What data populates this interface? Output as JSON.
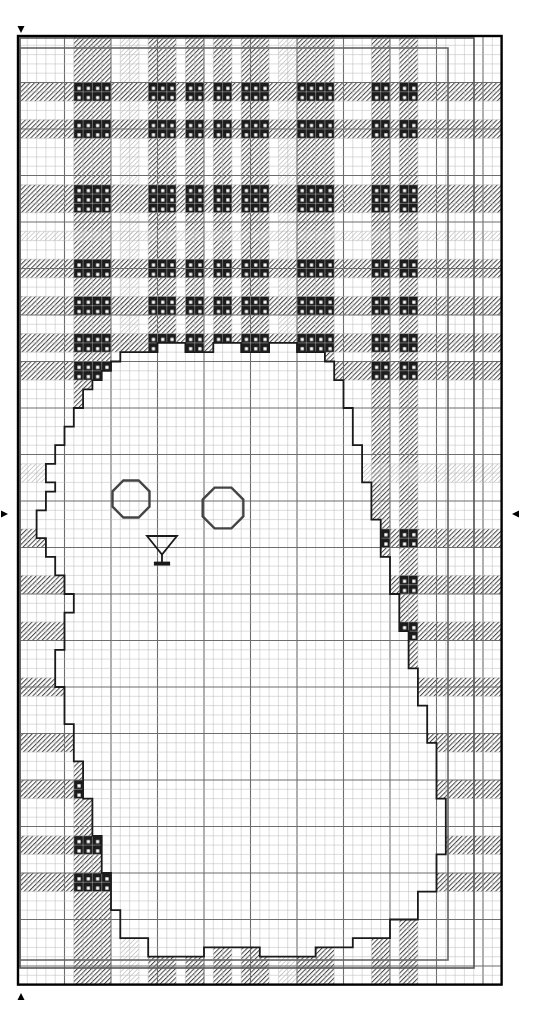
{
  "document": {
    "title": "Cross Stitch Pattern Chart",
    "type": "needlework-chart"
  },
  "canvas": {
    "width": 535,
    "height": 1016,
    "background_color": "#ffffff"
  },
  "grid": {
    "origin_x": 18,
    "origin_y": 36,
    "cell_size": 9.3,
    "cols": 52,
    "rows": 102,
    "minor_line_color": "#b8b8b8",
    "minor_line_width": 0.5,
    "major_line_color": "#6d6d6d",
    "major_line_width": 1.1,
    "major_every": 5,
    "outer_border_color": "#000000",
    "outer_border_width": 2.4
  },
  "center_markers": {
    "color": "#000000",
    "top": {
      "name": "top-center-marker",
      "x": 21,
      "y": 33,
      "direction": "down"
    },
    "bottom": {
      "name": "bottom-center-marker",
      "x": 21,
      "y": 993,
      "direction": "up"
    },
    "left": {
      "name": "left-center-marker",
      "x": 8,
      "y": 514,
      "direction": "right"
    },
    "right": {
      "name": "right-center-marker",
      "x": 512,
      "y": 514,
      "direction": "left"
    }
  },
  "inner_frames": [
    {
      "name": "inner-frame-outer",
      "x": 20,
      "y": 38,
      "width": 454,
      "height": 930,
      "color": "#555555",
      "width_px": 1.6
    },
    {
      "name": "inner-frame-inner",
      "x": 20,
      "y": 48,
      "width": 428,
      "height": 912,
      "color": "#666666",
      "width_px": 1.6
    }
  ],
  "plaid": {
    "name": "tartan-background",
    "description": "Tartan plaid fill occupying upper region and left/right margins",
    "colors": {
      "hatch_dark": "#3a3a3a",
      "hatch_mid": "#6a6a6a",
      "hatch_light": "#b4b4b4",
      "block_dark": "#1c1c1c",
      "block_dot": "#ffffff"
    },
    "vertical_bands": [
      {
        "col": 6,
        "span": 4,
        "style": "dark"
      },
      {
        "col": 11,
        "span": 2,
        "style": "light"
      },
      {
        "col": 14,
        "span": 3,
        "style": "dark"
      },
      {
        "col": 18,
        "span": 2,
        "style": "dark"
      },
      {
        "col": 21,
        "span": 2,
        "style": "dark"
      },
      {
        "col": 24,
        "span": 3,
        "style": "dark"
      },
      {
        "col": 28,
        "span": 2,
        "style": "light"
      },
      {
        "col": 30,
        "span": 4,
        "style": "dark"
      },
      {
        "col": 38,
        "span": 2,
        "style": "dark"
      },
      {
        "col": 41,
        "span": 2,
        "style": "dark"
      }
    ],
    "horizontal_bands": [
      {
        "row": 5,
        "span": 2,
        "style": "dark"
      },
      {
        "row": 9,
        "span": 2,
        "style": "dark"
      },
      {
        "row": 16,
        "span": 3,
        "style": "dark"
      },
      {
        "row": 21,
        "span": 1,
        "style": "light"
      },
      {
        "row": 24,
        "span": 2,
        "style": "dark"
      },
      {
        "row": 28,
        "span": 2,
        "style": "dark"
      },
      {
        "row": 32,
        "span": 2,
        "style": "dark"
      },
      {
        "row": 35,
        "span": 2,
        "style": "dark"
      },
      {
        "row": 46,
        "span": 2,
        "style": "light"
      },
      {
        "row": 53,
        "span": 2,
        "style": "dark"
      },
      {
        "row": 58,
        "span": 2,
        "style": "dark"
      },
      {
        "row": 63,
        "span": 2,
        "style": "dark"
      },
      {
        "row": 69,
        "span": 2,
        "style": "dark"
      },
      {
        "row": 75,
        "span": 2,
        "style": "dark"
      },
      {
        "row": 80,
        "span": 2,
        "style": "dark"
      },
      {
        "row": 86,
        "span": 2,
        "style": "dark"
      },
      {
        "row": 90,
        "span": 2,
        "style": "dark"
      }
    ]
  },
  "figure": {
    "name": "cat-silhouette",
    "outline_color": "#1a1a1a",
    "outline_width": 1.8,
    "fill": "#ffffff",
    "path_cells": [
      [
        11,
        34
      ],
      [
        11,
        35
      ],
      [
        10,
        35
      ],
      [
        10,
        36
      ],
      [
        9,
        36
      ],
      [
        9,
        37
      ],
      [
        8,
        37
      ],
      [
        8,
        38
      ],
      [
        7,
        38
      ],
      [
        7,
        40
      ],
      [
        6,
        40
      ],
      [
        6,
        42
      ],
      [
        5,
        42
      ],
      [
        5,
        44
      ],
      [
        4,
        44
      ],
      [
        4,
        46
      ],
      [
        3,
        46
      ],
      [
        3,
        48
      ],
      [
        4,
        48
      ],
      [
        4,
        49
      ],
      [
        3,
        49
      ],
      [
        3,
        51
      ],
      [
        2,
        51
      ],
      [
        2,
        54
      ],
      [
        3,
        54
      ],
      [
        3,
        56
      ],
      [
        4,
        56
      ],
      [
        4,
        58
      ],
      [
        5,
        58
      ],
      [
        5,
        60
      ],
      [
        6,
        60
      ],
      [
        6,
        62
      ],
      [
        5,
        62
      ],
      [
        5,
        66
      ],
      [
        4,
        66
      ],
      [
        4,
        70
      ],
      [
        5,
        70
      ],
      [
        5,
        74
      ],
      [
        6,
        74
      ],
      [
        6,
        78
      ],
      [
        7,
        78
      ],
      [
        7,
        82
      ],
      [
        8,
        82
      ],
      [
        8,
        86
      ],
      [
        9,
        86
      ],
      [
        9,
        90
      ],
      [
        10,
        90
      ],
      [
        10,
        94
      ],
      [
        11,
        94
      ],
      [
        11,
        97
      ],
      [
        14,
        97
      ],
      [
        14,
        99
      ],
      [
        20,
        99
      ],
      [
        20,
        98
      ],
      [
        26,
        98
      ],
      [
        26,
        99
      ],
      [
        32,
        99
      ],
      [
        32,
        98
      ],
      [
        36,
        98
      ],
      [
        36,
        97
      ],
      [
        40,
        97
      ],
      [
        40,
        95
      ],
      [
        43,
        95
      ],
      [
        43,
        92
      ],
      [
        45,
        92
      ],
      [
        45,
        88
      ],
      [
        46,
        88
      ],
      [
        46,
        82
      ],
      [
        45,
        82
      ],
      [
        45,
        76
      ],
      [
        44,
        76
      ],
      [
        44,
        72
      ],
      [
        43,
        72
      ],
      [
        43,
        68
      ],
      [
        42,
        68
      ],
      [
        42,
        64
      ],
      [
        41,
        64
      ],
      [
        41,
        60
      ],
      [
        40,
        60
      ],
      [
        40,
        56
      ],
      [
        39,
        56
      ],
      [
        39,
        52
      ],
      [
        38,
        52
      ],
      [
        38,
        48
      ],
      [
        37,
        48
      ],
      [
        37,
        44
      ],
      [
        36,
        44
      ],
      [
        36,
        40
      ],
      [
        35,
        40
      ],
      [
        35,
        37
      ],
      [
        34,
        37
      ],
      [
        34,
        35
      ],
      [
        33,
        35
      ],
      [
        33,
        34
      ],
      [
        30,
        34
      ],
      [
        30,
        33
      ],
      [
        27,
        33
      ],
      [
        27,
        34
      ],
      [
        24,
        34
      ],
      [
        24,
        33
      ],
      [
        21,
        33
      ],
      [
        21,
        34
      ],
      [
        18,
        34
      ],
      [
        18,
        33
      ],
      [
        15,
        33
      ],
      [
        15,
        34
      ],
      [
        11,
        34
      ]
    ]
  },
  "symbols": [
    {
      "name": "eye-left-octagon-symbol",
      "type": "octagon",
      "cx": 131,
      "cy": 499,
      "r": 20,
      "stroke": "#444444",
      "stroke_width": 2.4,
      "fill": "none"
    },
    {
      "name": "eye-right-octagon-symbol",
      "type": "octagon",
      "cx": 223,
      "cy": 508,
      "r": 22,
      "stroke": "#444444",
      "stroke_width": 2.4,
      "fill": "none"
    },
    {
      "name": "nose-martini-symbol",
      "type": "martini-glass",
      "cx": 162,
      "cy": 551,
      "w": 30,
      "h": 30,
      "stroke": "#1a1a1a",
      "stroke_width": 1.8,
      "fill": "none"
    }
  ],
  "legend": {
    "stitch_types": [
      {
        "label": "Dark hatch",
        "swatch": "#3a3a3a"
      },
      {
        "label": "Mid hatch",
        "swatch": "#6a6a6a"
      },
      {
        "label": "Light hatch",
        "swatch": "#b4b4b4"
      },
      {
        "label": "Solid dark with dot",
        "swatch": "#1c1c1c"
      }
    ]
  }
}
